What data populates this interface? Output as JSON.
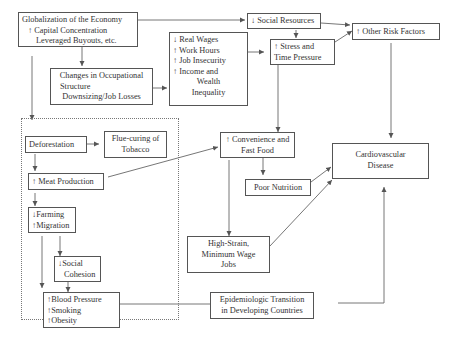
{
  "nodes": {
    "globalization": {
      "lines": [
        "Globalization of the Economy",
        "↑ Capital Concentration",
        "Leveraged Buyouts, etc."
      ]
    },
    "occupational": {
      "lines": [
        "Changes in Occupational",
        "Structure",
        "Downsizing/Job Losses"
      ]
    },
    "wages": {
      "lines": [
        "↓ Real Wages",
        "↑ Work Hours",
        "↑ Job Insecurity",
        "↑ Income and",
        "Wealth",
        "Inequality"
      ]
    },
    "social_resources": {
      "lines": [
        "↓ Social Resources"
      ]
    },
    "stress": {
      "lines": [
        "↑ Stress and",
        "Time Pressure"
      ]
    },
    "other_risk": {
      "lines": [
        "↑ Other Risk Factors"
      ]
    },
    "deforestation": {
      "lines": [
        "Deforestation"
      ]
    },
    "flue_curing": {
      "lines": [
        "Flue-curing of",
        "Tobacco"
      ]
    },
    "meat": {
      "lines": [
        "↑ Meat Production"
      ]
    },
    "farming": {
      "lines": [
        "↓Farming",
        "↑Migration"
      ]
    },
    "social_cohesion": {
      "lines": [
        "↓Social",
        "Cohesion"
      ]
    },
    "blood_pressure": {
      "lines": [
        "↑Blood Pressure",
        "↑Smoking",
        "↑Obesity"
      ]
    },
    "convenience": {
      "lines": [
        "↑ Convenience and",
        "Fast Food"
      ]
    },
    "poor_nutrition": {
      "lines": [
        "Poor Nutrition"
      ]
    },
    "high_strain": {
      "lines": [
        "High-Strain,",
        "Minimum Wage",
        "Jobs"
      ]
    },
    "epidemiologic": {
      "lines": [
        "Epidemiologic Transition",
        "in Developing Countries"
      ]
    },
    "cvd": {
      "lines": [
        "Cardiovascular",
        "Disease"
      ]
    }
  },
  "edges": [
    [
      "globalization",
      "social_resources"
    ],
    [
      "globalization",
      "occupational"
    ],
    [
      "globalization",
      "blood_pressure"
    ],
    [
      "occupational",
      "wages"
    ],
    [
      "wages",
      "stress"
    ],
    [
      "social_resources",
      "stress"
    ],
    [
      "social_resources",
      "other_risk"
    ],
    [
      "stress",
      "other_risk"
    ],
    [
      "stress",
      "convenience"
    ],
    [
      "other_risk",
      "cvd"
    ],
    [
      "deforestation",
      "flue_curing"
    ],
    [
      "deforestation",
      "meat"
    ],
    [
      "meat",
      "convenience"
    ],
    [
      "meat",
      "farming"
    ],
    [
      "farming",
      "social_cohesion"
    ],
    [
      "social_cohesion",
      "blood_pressure"
    ],
    [
      "convenience",
      "poor_nutrition"
    ],
    [
      "convenience",
      "high_strain"
    ],
    [
      "poor_nutrition",
      "cvd"
    ],
    [
      "high_strain",
      "cvd"
    ],
    [
      "blood_pressure",
      "epidemiologic"
    ],
    [
      "epidemiologic",
      "cvd"
    ]
  ]
}
